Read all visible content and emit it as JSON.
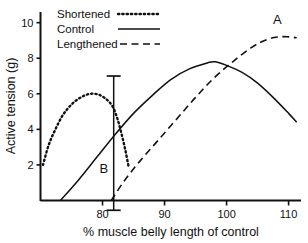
{
  "chart_data": {
    "type": "line",
    "title": "",
    "xlabel": "% muscle belly length of control",
    "ylabel": "Active tension (g)",
    "xlim": [
      70,
      112
    ],
    "ylim": [
      0,
      10.6
    ],
    "xticks": [
      80,
      90,
      100,
      110
    ],
    "xtick_labels": [
      "80",
      "90",
      "100",
      "110"
    ],
    "yticks": [
      2,
      4,
      6,
      8,
      10
    ],
    "ytick_labels": [
      "2",
      "4",
      "6",
      "8",
      "10"
    ],
    "grid": false,
    "legend_position": "top-left",
    "series": [
      {
        "name": "Shortened",
        "style": "dotted",
        "points": [
          [
            70.4,
            2.0
          ],
          [
            71.3,
            3.1
          ],
          [
            72.4,
            4.0
          ],
          [
            73.6,
            4.8
          ],
          [
            75.0,
            5.4
          ],
          [
            76.5,
            5.8
          ],
          [
            78.0,
            6.0
          ],
          [
            79.4,
            5.95
          ],
          [
            80.6,
            5.7
          ],
          [
            81.6,
            5.3
          ],
          [
            82.4,
            4.6
          ],
          [
            83.1,
            3.7
          ],
          [
            83.7,
            2.8
          ],
          [
            84.2,
            1.9
          ]
        ]
      },
      {
        "name": "Control",
        "style": "solid",
        "points": [
          [
            73.2,
            0.0
          ],
          [
            76.0,
            1.1
          ],
          [
            79.0,
            2.4
          ],
          [
            82.0,
            3.7
          ],
          [
            85.0,
            4.9
          ],
          [
            88.0,
            5.9
          ],
          [
            91.0,
            6.8
          ],
          [
            94.0,
            7.4
          ],
          [
            97.0,
            7.75
          ],
          [
            98.2,
            7.8
          ],
          [
            100.0,
            7.6
          ],
          [
            102.5,
            7.2
          ],
          [
            105.0,
            6.6
          ],
          [
            107.5,
            5.8
          ],
          [
            110.0,
            4.9
          ],
          [
            111.3,
            4.4
          ]
        ]
      },
      {
        "name": "Lengthened",
        "style": "dashed",
        "points": [
          [
            81.4,
            0.0
          ],
          [
            83.5,
            1.1
          ],
          [
            86.0,
            2.2
          ],
          [
            89.0,
            3.4
          ],
          [
            92.0,
            4.6
          ],
          [
            95.0,
            5.8
          ],
          [
            98.0,
            6.9
          ],
          [
            101.0,
            7.8
          ],
          [
            104.0,
            8.6
          ],
          [
            106.5,
            9.05
          ],
          [
            108.5,
            9.2
          ],
          [
            110.0,
            9.2
          ],
          [
            111.3,
            9.15
          ]
        ]
      }
    ],
    "annotations": [
      {
        "text": "A",
        "x": 108.2,
        "y": 9.9
      },
      {
        "text": "B",
        "x": 80.2,
        "y": 1.55
      }
    ],
    "error_bar": {
      "x": 81.8,
      "y_top": 7.0,
      "y_bottom": -0.55,
      "cap_half_width_px": 7
    }
  },
  "legend": {
    "entries": [
      {
        "label": "Shortened",
        "style": "dotted"
      },
      {
        "label": "Control",
        "style": "solid"
      },
      {
        "label": "Lengthened",
        "style": "dashed"
      }
    ]
  }
}
